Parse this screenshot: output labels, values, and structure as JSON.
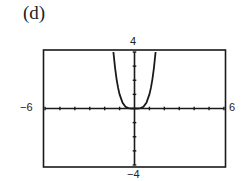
{
  "panel_label": "(d)",
  "chart_data": {
    "type": "line",
    "title": "",
    "panel": "(d)",
    "function": "y = x^4",
    "xlabel": "",
    "ylabel": "",
    "xlim": [
      -6,
      6
    ],
    "ylim": [
      -4,
      4
    ],
    "x_tick_step": 1,
    "y_tick_step": 1,
    "window_labels": {
      "xmin": "−6",
      "xmax": "6",
      "ymin": "−4",
      "ymax": "4"
    },
    "grid": false,
    "legend": null,
    "series": [
      {
        "name": "y = x^4",
        "x": [
          -1.414,
          -1.3,
          -1.2,
          -1.1,
          -1.0,
          -0.8,
          -0.6,
          -0.4,
          -0.2,
          0,
          0.2,
          0.4,
          0.6,
          0.8,
          1.0,
          1.1,
          1.2,
          1.3,
          1.414
        ],
        "y": [
          4.0,
          2.86,
          2.07,
          1.46,
          1.0,
          0.41,
          0.13,
          0.03,
          0.0,
          0,
          0.0,
          0.03,
          0.13,
          0.41,
          1.0,
          1.46,
          2.07,
          2.86,
          4.0
        ]
      }
    ]
  }
}
